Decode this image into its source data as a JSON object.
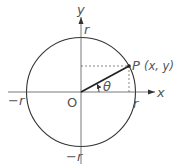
{
  "diagram": {
    "type": "unit-circle-polar",
    "axis_labels": {
      "x": "x",
      "y": "y"
    },
    "origin_label": "O",
    "radius_labels": {
      "pos_x": "r",
      "neg_x": "−r",
      "pos_y": "r",
      "neg_y": "−r"
    },
    "point": {
      "name": "P",
      "coords": "(x, y)"
    },
    "angle_label": "θ",
    "colors": {
      "stroke": "#333333",
      "text": "#555555",
      "background": "#ffffff"
    }
  }
}
